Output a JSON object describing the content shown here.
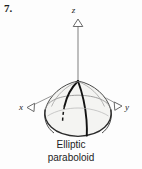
{
  "problem": {
    "number": "7."
  },
  "figure": {
    "caption_line1": "Elliptic",
    "caption_line2": "paraboloid",
    "axes": [
      {
        "name": "z-axis",
        "label": "z"
      },
      {
        "name": "x-axis",
        "label": "x"
      },
      {
        "name": "y-axis",
        "label": "y"
      }
    ],
    "axis_labels": {
      "z": "z",
      "x": "x",
      "y": "y"
    },
    "surface_name": "Elliptic paraboloid",
    "colors": {
      "ink": "#1c1c1c",
      "outline": "#2b2b2b",
      "thin_line": "#7a7a7a",
      "fill": "#f4f4f2",
      "background": "#fdfdfd"
    }
  }
}
